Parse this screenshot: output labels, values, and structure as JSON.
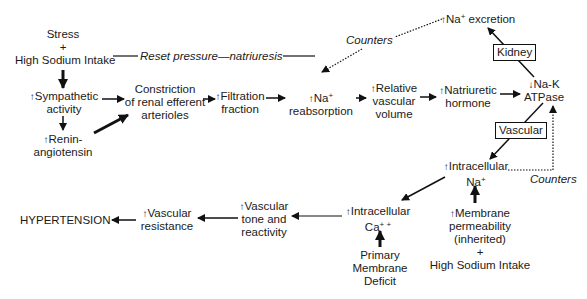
{
  "diagram": {
    "nodes": {
      "stress": {
        "l1": "Stress",
        "l2": "+",
        "l3": "High Sodium Intake"
      },
      "reset": {
        "label": "Reset pressure—natriuresis"
      },
      "symp": {
        "arrow": "↑",
        "l1": "Sympathetic",
        "l2": "activity"
      },
      "renin": {
        "arrow": "↑",
        "l1": "Renin-",
        "l2": "angiotensin"
      },
      "constriction": {
        "l1": "Constriction",
        "l2": "of renal efferent",
        "l3": "arterioles"
      },
      "filtration": {
        "arrow": "↑",
        "l1": "Filtration",
        "l2": "fraction"
      },
      "reabsorption": {
        "arrow": "↑",
        "l1": "Na",
        "sup": "+",
        "l2": "reabsorption"
      },
      "volume": {
        "arrow": "↑",
        "l1": "Relative",
        "l2": "vascular",
        "l3": "volume"
      },
      "natriuretic": {
        "arrow": "↑",
        "l1": "Natriuretic",
        "l2": "hormone"
      },
      "excretion": {
        "arrow": "↑",
        "l1": "Na",
        "sup": "+",
        "l2": " excretion"
      },
      "kidney": {
        "label": "Kidney"
      },
      "nak": {
        "arrow": "↓",
        "l1": "Na-K",
        "l2": "ATPase"
      },
      "vascular_box": {
        "label": "Vascular"
      },
      "counters_top": {
        "label": "Counters"
      },
      "counters_right": {
        "label": "Counters"
      },
      "intra_na": {
        "arrow": "↑",
        "l1": "Intracellular",
        "l2": "Na",
        "sup": "+"
      },
      "membrane": {
        "arrow": "↑",
        "l1": "Membrane",
        "l2": "permeability",
        "l3": "(inherited)",
        "l4": "+",
        "l5": "High Sodium Intake"
      },
      "intra_ca": {
        "arrow": "↑",
        "l1": "Intracellular",
        "l2": "Ca",
        "sup": "+ +"
      },
      "primary": {
        "l1": "Primary",
        "l2": "Membrane",
        "l3": "Deficit"
      },
      "tone": {
        "arrow": "↑",
        "l1": "Vascular",
        "l2": "tone and",
        "l3": "reactivity"
      },
      "resistance": {
        "arrow": "↑",
        "l1": "Vascular",
        "l2": "resistance"
      },
      "hypertension": {
        "label": "HYPERTENSION"
      }
    }
  }
}
